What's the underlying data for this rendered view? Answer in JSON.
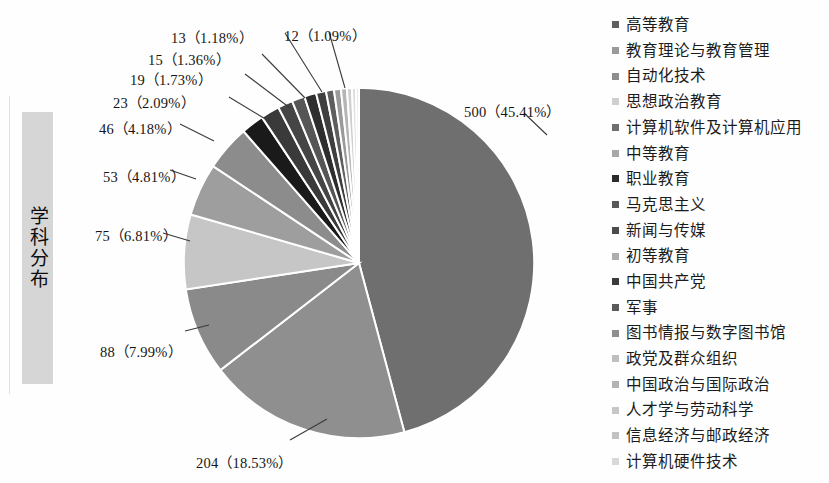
{
  "row_label": {
    "text": "学科分布"
  },
  "chart_data": {
    "type": "pie",
    "title": "学科分布",
    "total": 1101,
    "value_unit": "篇",
    "start_angle_deg": -90,
    "direction": "clockwise",
    "slice_stroke": "#ffffff",
    "legend_position": "right",
    "grid": false,
    "categories": [
      "高等教育",
      "教育理论与教育管理",
      "自动化技术",
      "思想政治教育",
      "计算机软件及计算机应用",
      "中等教育",
      "职业教育",
      "马克思主义",
      "新闻与传媒",
      "初等教育",
      "中国共产党",
      "军事",
      "图书情报与数字图书馆",
      "政党及群众组织",
      "中国政治与国际政治",
      "人才学与劳动科学",
      "信息经济与邮政经济",
      "计算机硬件技术"
    ],
    "values": [
      500,
      204,
      88,
      75,
      53,
      46,
      23,
      19,
      15,
      13,
      12,
      10,
      8,
      7,
      6,
      5,
      4,
      3
    ],
    "percents": [
      45.41,
      18.53,
      7.99,
      6.81,
      4.81,
      4.18,
      2.09,
      1.73,
      1.36,
      1.18,
      1.09,
      0.91,
      0.73,
      0.64,
      0.54,
      0.45,
      0.36,
      0.27
    ],
    "colors": [
      "#6f6f6f",
      "#8f8f8f",
      "#8a8a8a",
      "#c6c6c6",
      "#9e9e9e",
      "#8c8c8c",
      "#1a1a1a",
      "#3a3a3a",
      "#454545",
      "#565656",
      "#2e2e2e",
      "#3f3f3f",
      "#5e5e5e",
      "#9a9a9a",
      "#b5b5b5",
      "#cfcfcf",
      "#dcdcdc",
      "#e8e8e8"
    ],
    "legend_swatch_colors": [
      "#5f5f5f",
      "#9a9a9a",
      "#8d8d8d",
      "#cfcfcf",
      "#6e6e6e",
      "#a8a8a8",
      "#2b2b2b",
      "#585858",
      "#4b4b4b",
      "#adadad",
      "#3b3b3b",
      "#5a5a5a",
      "#8f8f8f",
      "#bfbfbf",
      "#b3b3b3",
      "#c7c7c7",
      "#c2c2c2",
      "#d8d8d8"
    ],
    "data_labels": [
      {
        "text": "500（45.41%）",
        "value": 500,
        "percent": 45.41,
        "category": "高等教育"
      },
      {
        "text": "204（18.53%）",
        "value": 204,
        "percent": 18.53,
        "category": "教育理论与教育管理"
      },
      {
        "text": "88（7.99%）",
        "value": 88,
        "percent": 7.99,
        "category": "自动化技术"
      },
      {
        "text": "75（6.81%）",
        "value": 75,
        "percent": 6.81,
        "category": "思想政治教育"
      },
      {
        "text": "53（4.81%）",
        "value": 53,
        "percent": 4.81,
        "category": "计算机软件及计算机应用"
      },
      {
        "text": "46（4.18%）",
        "value": 46,
        "percent": 4.18,
        "category": "中等教育"
      },
      {
        "text": "23（2.09%）",
        "value": 23,
        "percent": 2.09,
        "category": "职业教育"
      },
      {
        "text": "19（1.73%）",
        "value": 19,
        "percent": 1.73,
        "category": "马克思主义"
      },
      {
        "text": "15（1.36%）",
        "value": 15,
        "percent": 1.36,
        "category": "新闻与传媒"
      },
      {
        "text": "13（1.18%）",
        "value": 13,
        "percent": 1.18,
        "category": "初等教育"
      },
      {
        "text": "12（1.09%）",
        "value": 12,
        "percent": 1.09,
        "category": "中国共产党"
      }
    ]
  }
}
